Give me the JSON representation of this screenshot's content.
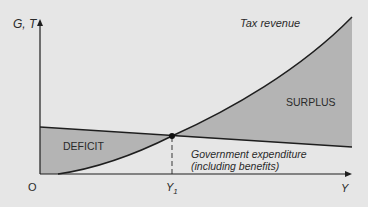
{
  "diagram": {
    "y_axis_label": "G, T",
    "x_axis_label": "Y",
    "origin_label": "O",
    "y1_label": "Y",
    "y1_subscript": "1",
    "tax_label": "Tax revenue",
    "surplus_label": "SURPLUS",
    "deficit_label": "DEFICIT",
    "gov_label_line1": "Government expenditure",
    "gov_label_line2": "(including benefits)"
  },
  "colors": {
    "background": "#e6e6e6",
    "shade": "#b4b4b4",
    "line": "#1e1e1e"
  }
}
